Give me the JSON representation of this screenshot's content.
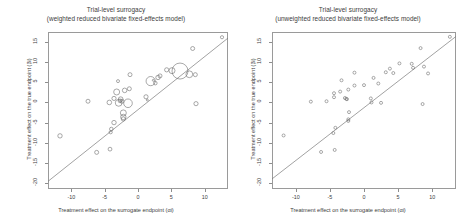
{
  "figure": {
    "width": 464,
    "height": 224,
    "background": "#ffffff",
    "point_color": "#6e6e6e",
    "line_color": "#7a7a7a",
    "axis_color": "#9a9a9a"
  },
  "panels": [
    {
      "id": "left",
      "title_line1": "Trial-level surrogacy",
      "title_line2": "(weighted reduced bivariate fixed-effects model)",
      "xlabel": "Treatment effect on the surrogate endpoint (αi)",
      "ylabel": "Treatment effect on the true endpoint (βi)",
      "xticks": [
        "-10",
        "-5",
        "0",
        "5",
        "10"
      ],
      "yticks": [
        "15",
        "10",
        "5",
        "0",
        "-5",
        "-10",
        "-15",
        "-20"
      ]
    },
    {
      "id": "right",
      "title_line1": "Trial-level surrogacy",
      "title_line2": "(unweighted reduced bivariate fixed-effects model)",
      "xlabel": "Treatment effect on the surrogate endpoint (αi)",
      "ylabel": "Treatment effect on the true endpoint (βi)",
      "xticks": [
        "-10",
        "-5",
        "0",
        "5",
        "10"
      ],
      "yticks": [
        "15",
        "10",
        "5",
        "0",
        "-5",
        "-10",
        "-15",
        "-20"
      ]
    }
  ],
  "chart_data": [
    {
      "type": "scatter",
      "panel": "left",
      "title": "Trial-level surrogacy (weighted reduced bivariate fixed-effects model)",
      "xlabel": "Treatment effect on the surrogate endpoint (αi)",
      "ylabel": "Treatment effect on the true endpoint (βi)",
      "xlim": [
        -13.5,
        13.5
      ],
      "ylim": [
        -21.5,
        17.5
      ],
      "xticks": [
        -10,
        -5,
        0,
        5,
        10
      ],
      "yticks": [
        15,
        10,
        5,
        0,
        -5,
        -10,
        -15,
        -20
      ],
      "grid": false,
      "legend": false,
      "marker": "open-circle-weighted-by-trial-size",
      "fit_line": {
        "x": [
          -13.5,
          13.5
        ],
        "y": [
          -19.6,
          16.0
        ]
      },
      "points": [
        {
          "x": 12.6,
          "y": 16.2,
          "size": 1.6
        },
        {
          "x": 8.2,
          "y": 13.4,
          "size": 2.0
        },
        {
          "x": 6.3,
          "y": 7.8,
          "size": 8.0
        },
        {
          "x": 5.1,
          "y": 7.9,
          "size": 3.0
        },
        {
          "x": 4.3,
          "y": 8.1,
          "size": 2.1
        },
        {
          "x": 7.7,
          "y": 7.0,
          "size": 3.4
        },
        {
          "x": 8.6,
          "y": 6.9,
          "size": 2.0
        },
        {
          "x": 3.3,
          "y": 6.6,
          "size": 2.0
        },
        {
          "x": 3.0,
          "y": 6.2,
          "size": 2.2
        },
        {
          "x": -1.2,
          "y": 6.9,
          "size": 2.0
        },
        {
          "x": -3.0,
          "y": 5.3,
          "size": 1.5
        },
        {
          "x": 2.3,
          "y": 5.5,
          "size": 1.0
        },
        {
          "x": 1.9,
          "y": 5.3,
          "size": 4.6
        },
        {
          "x": 2.6,
          "y": 4.8,
          "size": 1.8
        },
        {
          "x": -1.3,
          "y": 3.4,
          "size": 2.0
        },
        {
          "x": -2.0,
          "y": 3.0,
          "size": 2.3
        },
        {
          "x": -3.2,
          "y": 2.6,
          "size": 3.0
        },
        {
          "x": 1.2,
          "y": 1.4,
          "size": 2.1
        },
        {
          "x": 1.4,
          "y": 0.6,
          "size": 1.0
        },
        {
          "x": -3.6,
          "y": 1.0,
          "size": 2.1
        },
        {
          "x": -2.6,
          "y": 0.8,
          "size": 2.4
        },
        {
          "x": -2.7,
          "y": 0.4,
          "size": 1.9
        },
        {
          "x": -2.4,
          "y": 0.3,
          "size": 2.0
        },
        {
          "x": -2.9,
          "y": -0.1,
          "size": 3.4
        },
        {
          "x": -4.3,
          "y": 0.0,
          "size": 2.3
        },
        {
          "x": -1.5,
          "y": -0.2,
          "size": 4.3
        },
        {
          "x": -7.5,
          "y": 0.3,
          "size": 2.0
        },
        {
          "x": 8.7,
          "y": -0.3,
          "size": 2.1
        },
        {
          "x": -2.2,
          "y": -2.6,
          "size": 3.0
        },
        {
          "x": -2.2,
          "y": -3.6,
          "size": 2.7
        },
        {
          "x": -2.2,
          "y": -4.1,
          "size": 2.1
        },
        {
          "x": -3.6,
          "y": -5.0,
          "size": 2.2
        },
        {
          "x": -4.0,
          "y": -6.6,
          "size": 1.8
        },
        {
          "x": -4.1,
          "y": -7.4,
          "size": 1.6
        },
        {
          "x": -11.7,
          "y": -8.3,
          "size": 2.2
        },
        {
          "x": -4.2,
          "y": -11.6,
          "size": 1.9
        },
        {
          "x": -6.2,
          "y": -12.4,
          "size": 2.0
        }
      ]
    },
    {
      "type": "scatter",
      "panel": "right",
      "title": "Trial-level surrogacy (unweighted reduced bivariate fixed-effects model)",
      "xlabel": "Treatment effect on the surrogate endpoint (αi)",
      "ylabel": "Treatment effect on the true endpoint (βi)",
      "xlim": [
        -13.5,
        13.5
      ],
      "ylim": [
        -21.5,
        17.5
      ],
      "xticks": [
        -10,
        -5,
        0,
        5,
        10
      ],
      "yticks": [
        15,
        10,
        5,
        0,
        -5,
        -10,
        -15,
        -20
      ],
      "grid": false,
      "legend": false,
      "marker": "open-circle-uniform",
      "fit_line": {
        "x": [
          -13.5,
          13.5
        ],
        "y": [
          -19.0,
          16.4
        ]
      },
      "points": [
        {
          "x": 12.6,
          "y": 16.3,
          "size": 1.5
        },
        {
          "x": 8.3,
          "y": 13.5,
          "size": 1.5
        },
        {
          "x": 7.0,
          "y": 9.6,
          "size": 1.5
        },
        {
          "x": 5.2,
          "y": 9.7,
          "size": 1.5
        },
        {
          "x": 8.8,
          "y": 8.9,
          "size": 1.5
        },
        {
          "x": 7.2,
          "y": 8.6,
          "size": 1.5
        },
        {
          "x": 3.8,
          "y": 8.4,
          "size": 1.5
        },
        {
          "x": 9.4,
          "y": 7.2,
          "size": 1.5
        },
        {
          "x": 4.3,
          "y": 7.3,
          "size": 1.5
        },
        {
          "x": 3.2,
          "y": 7.5,
          "size": 1.5
        },
        {
          "x": -1.4,
          "y": 7.4,
          "size": 1.5
        },
        {
          "x": 1.4,
          "y": 6.1,
          "size": 1.5
        },
        {
          "x": -3.3,
          "y": 5.5,
          "size": 1.5
        },
        {
          "x": 2.1,
          "y": 4.7,
          "size": 1.5
        },
        {
          "x": 0.0,
          "y": 4.3,
          "size": 1.5
        },
        {
          "x": -1.4,
          "y": 4.2,
          "size": 1.5
        },
        {
          "x": -2.3,
          "y": 3.2,
          "size": 1.5
        },
        {
          "x": -3.5,
          "y": 2.7,
          "size": 1.5
        },
        {
          "x": -4.4,
          "y": 2.3,
          "size": 1.5
        },
        {
          "x": -4.4,
          "y": 1.3,
          "size": 1.5
        },
        {
          "x": -2.8,
          "y": 1.1,
          "size": 1.5
        },
        {
          "x": -2.6,
          "y": 0.9,
          "size": 1.5
        },
        {
          "x": -2.5,
          "y": 0.8,
          "size": 1.5
        },
        {
          "x": -5.5,
          "y": 0.3,
          "size": 1.5
        },
        {
          "x": -7.8,
          "y": 0.2,
          "size": 1.5
        },
        {
          "x": 1.0,
          "y": 1.0,
          "size": 1.5
        },
        {
          "x": 1.1,
          "y": 0.0,
          "size": 1.5
        },
        {
          "x": 2.5,
          "y": -0.1,
          "size": 1.5
        },
        {
          "x": 8.6,
          "y": -0.4,
          "size": 1.5
        },
        {
          "x": -2.2,
          "y": -2.4,
          "size": 1.5
        },
        {
          "x": -2.3,
          "y": -4.2,
          "size": 1.5
        },
        {
          "x": -2.3,
          "y": -4.6,
          "size": 1.5
        },
        {
          "x": -4.2,
          "y": -6.3,
          "size": 1.5
        },
        {
          "x": -4.5,
          "y": -7.6,
          "size": 1.5
        },
        {
          "x": -11.8,
          "y": -8.2,
          "size": 1.5
        },
        {
          "x": -4.3,
          "y": -11.8,
          "size": 1.5
        },
        {
          "x": -6.3,
          "y": -12.3,
          "size": 1.5
        }
      ]
    }
  ]
}
